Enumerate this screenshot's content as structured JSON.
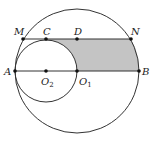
{
  "figure": {
    "type": "geometry-diagram",
    "colors": {
      "stroke": "#333333",
      "shade": "#c4c4c4",
      "point": "#111111",
      "background": "#ffffff"
    },
    "circles": [
      {
        "name": "big-circle",
        "center": "O1",
        "cx": 77,
        "cy": 71,
        "r": 62
      },
      {
        "name": "small-circle",
        "center": "O2",
        "cx": 46,
        "cy": 71,
        "r": 31
      }
    ],
    "segments": [
      {
        "name": "diameter-AB",
        "from": "A",
        "to": "B"
      },
      {
        "name": "chord-MN",
        "from": "M",
        "to": "N"
      }
    ],
    "shaded_region": "Region bounded by CD-to-N on chord MN, arc NB of big circle, segment BO1, and arc O1C of small circle",
    "points": {
      "M": {
        "label": "M",
        "x": 23,
        "y": 39
      },
      "C": {
        "label": "C",
        "x": 46,
        "y": 39
      },
      "D": {
        "label": "D",
        "x": 77,
        "y": 39
      },
      "N": {
        "label": "N",
        "x": 131,
        "y": 39
      },
      "A": {
        "label": "A",
        "x": 15,
        "y": 71
      },
      "O2": {
        "label": "O",
        "sub": "2",
        "x": 46,
        "y": 71
      },
      "O1": {
        "label": "O",
        "sub": "1",
        "x": 77,
        "y": 71
      },
      "B": {
        "label": "B",
        "x": 139,
        "y": 71
      }
    }
  }
}
